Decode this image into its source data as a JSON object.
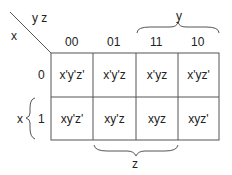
{
  "kmap": {
    "corner": {
      "col_vars": "y z",
      "row_var": "x"
    },
    "column_headers": [
      "00",
      "01",
      "11",
      "10"
    ],
    "row_headers": [
      "0",
      "1"
    ],
    "cells": [
      [
        "x'y'z'",
        "x'y'z",
        "x'yz",
        "x'yz'"
      ],
      [
        "xy'z'",
        "xy'z",
        "xyz",
        "xyz'"
      ]
    ],
    "brace_labels": {
      "top": "y",
      "bottom": "z",
      "left": "x"
    }
  }
}
